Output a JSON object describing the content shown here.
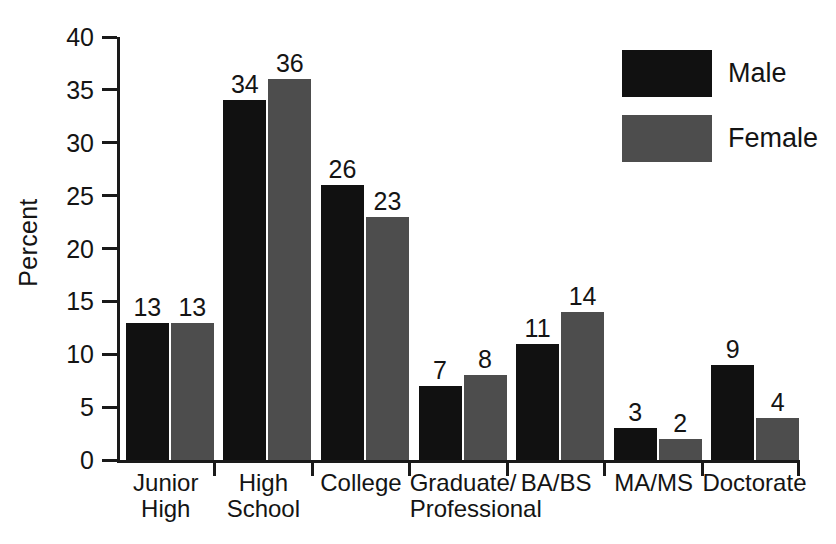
{
  "chart_data": {
    "type": "bar",
    "title": "",
    "xlabel": "",
    "ylabel": "Percent",
    "ylim": [
      0,
      40
    ],
    "yticks": [
      0,
      5,
      10,
      15,
      20,
      25,
      30,
      35,
      40
    ],
    "ytick_labels": [
      "0",
      "5",
      "10",
      "15",
      "20",
      "25",
      "30",
      "35",
      "40"
    ],
    "grid": false,
    "legend_position": "top-right",
    "categories": [
      "Junior High",
      "High School",
      "College",
      "Graduate/ Professional",
      "BA/BS",
      "MA/MS",
      "Doctorate"
    ],
    "category_lines": [
      {
        "line1": "Junior",
        "line2": "High"
      },
      {
        "line1": "High",
        "line2": "School"
      },
      {
        "line1": "College",
        "line2": ""
      },
      {
        "line1": "Graduate/",
        "line2": "Professional"
      },
      {
        "line1": "BA/BS",
        "line2": ""
      },
      {
        "line1": "MA/MS",
        "line2": ""
      },
      {
        "line1": "Doctorate",
        "line2": ""
      }
    ],
    "series": [
      {
        "name": "Male",
        "color": "#111111",
        "values": [
          13,
          34,
          26,
          7,
          11,
          3,
          9
        ],
        "value_labels": [
          "13",
          "34",
          "26",
          "7",
          "11",
          "3",
          "9"
        ]
      },
      {
        "name": "Female",
        "color": "#4d4d4d",
        "values": [
          13,
          36,
          23,
          8,
          14,
          2,
          4
        ],
        "value_labels": [
          "13",
          "36",
          "23",
          "8",
          "14",
          "2",
          "4"
        ]
      }
    ]
  },
  "legend": {
    "items": [
      {
        "label": "Male",
        "color": "#111111"
      },
      {
        "label": "Female",
        "color": "#4d4d4d"
      }
    ]
  }
}
